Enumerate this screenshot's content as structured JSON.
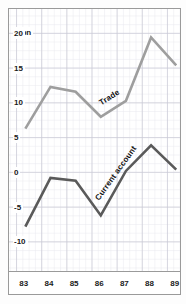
{
  "chart_data": {
    "type": "line",
    "title": "",
    "xlabel": "",
    "ylabel": "$bn",
    "unit_label": "$bn",
    "x": [
      "83",
      "84",
      "85",
      "86",
      "87",
      "88",
      "89"
    ],
    "categories": [
      "83",
      "84",
      "85",
      "86",
      "87",
      "88",
      "89"
    ],
    "xtick_labels": [
      "83",
      "84",
      "85",
      "86",
      "87",
      "88",
      "89"
    ],
    "ytick_labels": [
      "20",
      "15",
      "10",
      "5",
      "0",
      "-5",
      "-10",
      "-15"
    ],
    "ytick_values": [
      20,
      15,
      10,
      5,
      0,
      -5,
      -10,
      -15
    ],
    "ylim": [
      -17.5,
      23.5
    ],
    "xlim": [
      82.7,
      89.5
    ],
    "grid": true,
    "legend": "inline-labels",
    "legend_position": "on-series",
    "series": [
      {
        "name": "Trade",
        "color": "#9e9e9e",
        "label": "Trade",
        "values": [
          6.3,
          12.3,
          11.6,
          8.0,
          10.3,
          19.4,
          15.4
        ]
      },
      {
        "name": "Current account",
        "color": "#5a5a5a",
        "label": "Current account",
        "values": [
          -7.8,
          -0.8,
          -1.2,
          -6.2,
          0.2,
          3.9,
          0.4
        ]
      }
    ],
    "annotations": [
      {
        "text": "Trade",
        "series": "Trade"
      },
      {
        "text": "Current account",
        "series": "Current account"
      }
    ]
  },
  "style": {
    "background": "#ffffff",
    "grid_major_color": "#c8c8d2",
    "grid_minor_color": "#e8e8ee",
    "frame_color": "#9a9a9a",
    "trade_color": "#9e9e9e",
    "current_account_color": "#5a5a5a",
    "text_color": "#1a1a1a"
  }
}
